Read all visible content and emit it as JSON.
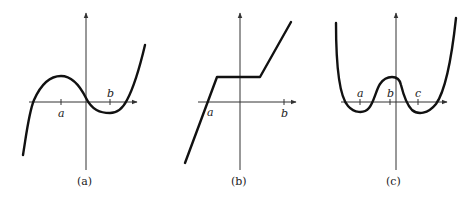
{
  "figures": [
    {
      "id": "a",
      "caption": "(a)",
      "description": "Cubic curve with local max above tick a and local min near tick b",
      "tick_labels": [
        "a",
        "b"
      ]
    },
    {
      "id": "b",
      "caption": "(b)",
      "description": "Piecewise linear: rising line, flat segment crossing y-axis, rising line",
      "tick_labels": [
        "a",
        "b"
      ]
    },
    {
      "id": "c",
      "caption": "(c)",
      "description": "Quartic W-shaped curve with minima near a and c, local max near b",
      "tick_labels": [
        "a",
        "b",
        "c"
      ]
    }
  ],
  "colors": {
    "curve": "#111111",
    "axis": "#333333",
    "background": "#ffffff"
  }
}
